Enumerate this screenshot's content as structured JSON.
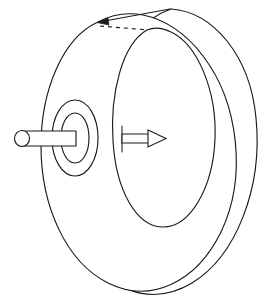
{
  "figure": {
    "background_color": "#ffffff",
    "stroke_color": "#1a1a1a",
    "width": 274,
    "height": 305,
    "caption": ""
  },
  "parts": {
    "wheel_outer_rim": {
      "name": "wheel outer rim",
      "label": ""
    },
    "wheel_face": {
      "name": "wheel front face disc",
      "label": ""
    },
    "wheel_hole": {
      "name": "central hole",
      "label": ""
    },
    "hub_outer": {
      "name": "hub outer ring",
      "label": ""
    },
    "hub_inner": {
      "name": "hub inner ring",
      "label": ""
    },
    "axle_shaft": {
      "name": "axle shaft",
      "label": ""
    },
    "axle_cap": {
      "name": "axle end cap",
      "label": ""
    },
    "axis_arrow": {
      "name": "axis direction arrow",
      "label": ""
    },
    "top_indicator": {
      "name": "top edge indicator arrow",
      "label": ""
    },
    "hidden_edge": {
      "name": "hidden edge dashed line",
      "label": ""
    }
  },
  "geometry": {
    "rim_outer_path": "M 171 9 C 213 12 250 55 256 118 C 263 188 236 256 192 283 C 150 308 103 290 83 242",
    "rim_back_path": "M 171 9 C 145 18 122 43 111 79",
    "face_outline_path": "M 98 22 C 62 38 41 92 41 146 C 41 206 66 262 108 283 C 150 304 196 283 221 232 C 247 178 239 103 203 56 C 186 33 164 19 143 15 C 127 12 111 15 98 22 Z",
    "hole_path": "M 147 30 C 122 44 110 94 113 141 C 116 190 136 226 162 227 C 190 228 213 188 215 139 C 217 90 197 44 171 32 C 163 28 154 27 147 30 Z",
    "hub_outer_path": "M 75 100 C 62 100 52 117 52 138 C 52 159 62 176 75 176 C 88 176 98 159 98 138 C 98 117 88 100 75 100 Z",
    "hub_inner_path": "M 75 113 C 67 113 61 124 61 138 C 61 152 67 163 75 163 C 83 163 89 152 89 138 C 89 124 83 113 75 113 Z",
    "axle_body_path": "M 22 131 L 76 131 L 76 146 L 22 146 Z",
    "axle_cap_ellipse": {
      "cx": 22,
      "cy": 138.5,
      "rx": 7.5,
      "ry": 8
    },
    "axis_arrow_body": "M 122 134 L 150 134 L 150 143 L 122 143 Z",
    "axis_arrow_head": "M 148 130 L 166 138.5 L 148 147 Z",
    "axis_arrow_tail": "M 122 126 L 122 152",
    "top_indicator_line": "M 170 9 L 99 22",
    "top_indicator_head": "M 108 18 L 97 22.5 L 109 25 Z",
    "hidden_dashed_line": "M 100 26 L 148 30"
  }
}
